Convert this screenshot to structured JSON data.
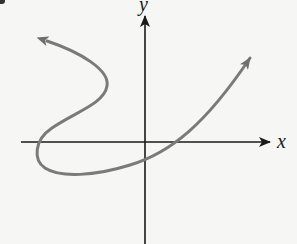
{
  "figure": {
    "title": "",
    "axes": {
      "x_label": "x",
      "y_label": "y",
      "axis_color": "#1a1a1a"
    },
    "curve": {
      "description": "Smooth parametric curve, not a function of x; enters from upper-left with arrow, bends right, loops back left across the x-axis, sweeps below the x-axis through the negative y-intercept, crosses the positive x-axis and exits upper-right with arrow.",
      "color": "#7a7a7a",
      "arrowheads": [
        "start-upper-left",
        "end-upper-right"
      ]
    },
    "background": "#f6f6f4"
  }
}
